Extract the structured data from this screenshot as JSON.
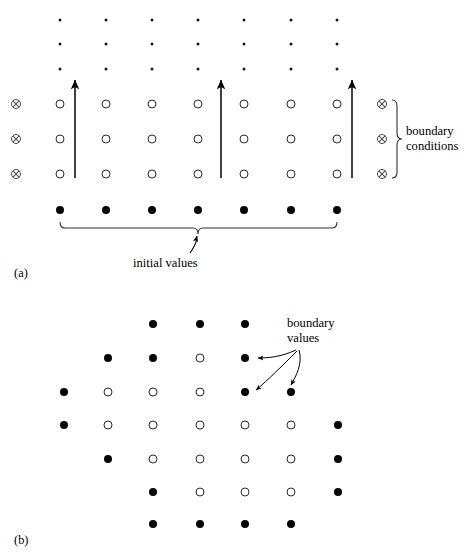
{
  "figure": {
    "background": "#ffffff",
    "ink": "#000000",
    "width": 474,
    "height": 557
  },
  "panels": [
    {
      "id": "a",
      "tag": "(a)",
      "tag_pos": {
        "x": 14,
        "y": 266
      },
      "description": "Time-marching grid: initial values on bottom row, boundary conditions on left and right columns, arrows showing marching direction",
      "columns_x": [
        60,
        106,
        152,
        198,
        244,
        291,
        337
      ],
      "open_rows_y": [
        104,
        139,
        174
      ],
      "dot_rows_y": [
        20,
        44,
        69
      ],
      "initial_row_y": 210,
      "boundary_col_left_x": 16,
      "boundary_col_right_x": 382,
      "arrows": [
        {
          "x": 75,
          "y_start": 178,
          "y_end": 78
        },
        {
          "x": 221,
          "y_start": 178,
          "y_end": 78
        },
        {
          "x": 352,
          "y_start": 178,
          "y_end": 78
        }
      ],
      "labels": [
        {
          "name": "boundary-conditions-label",
          "text": "boundary\nconditions",
          "x": 406,
          "y": 124
        },
        {
          "name": "initial-values-label",
          "text": "initial values",
          "x": 133,
          "y": 256
        }
      ],
      "brace_bottom": {
        "x_left": 60,
        "x_right": 337,
        "y": 228,
        "depth": 7
      },
      "brace_right": {
        "y_top": 104,
        "y_bottom": 174,
        "x": 396,
        "depth": 7
      },
      "legend": {
        "open_circle": "interior unknown value",
        "filled_circle": "known initial value",
        "circled_x": "boundary condition",
        "small_dot": "grid continues upward"
      }
    },
    {
      "id": "b",
      "tag": "(b)",
      "tag_pos": {
        "x": 14,
        "y": 533
      },
      "description": "Irregular/elliptic domain grid: filled circles are boundary values, open circles are interior unknowns",
      "columns_x": [
        64,
        108,
        153,
        200,
        245,
        291,
        338
      ],
      "rows_y": [
        324,
        358,
        392,
        425,
        459,
        492,
        524
      ],
      "grid": [
        [
          null,
          null,
          "filled",
          "filled",
          "filled",
          null,
          null
        ],
        [
          null,
          "filled",
          "filled",
          "open",
          "filled",
          null,
          null
        ],
        [
          "filled",
          "open",
          "open",
          "open",
          "filled",
          "filled",
          null
        ],
        [
          "filled",
          "open",
          "open",
          "open",
          "open",
          "open",
          "filled"
        ],
        [
          null,
          "filled",
          "open",
          "open",
          "open",
          "open",
          "filled"
        ],
        [
          null,
          null,
          "filled",
          "open",
          "open",
          "open",
          "filled"
        ],
        [
          null,
          null,
          "filled",
          "filled",
          "filled",
          "filled",
          null
        ]
      ],
      "labels": [
        {
          "name": "boundary-values-label",
          "text": "boundary\nvalues",
          "x": 287,
          "y": 316
        }
      ],
      "arrow_origin": {
        "x": 296,
        "y": 349
      },
      "arrow_targets": [
        {
          "x": 253,
          "y": 358
        },
        {
          "x": 253,
          "y": 392
        },
        {
          "x": 291,
          "y": 392
        }
      ]
    }
  ]
}
